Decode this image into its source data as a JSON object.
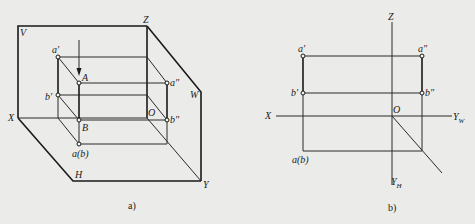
{
  "figure_a": {
    "caption": "a)",
    "planes": {
      "V": "V",
      "H": "H",
      "W": "W"
    },
    "axes": {
      "X": "X",
      "Y": "Y",
      "Z": "Z",
      "O": "O"
    },
    "points": {
      "a_prime": "a′",
      "b_prime": "b′",
      "A": "A",
      "B": "B",
      "a_dprime": "a″",
      "b_dprime": "b″",
      "ab_h": "a(b)"
    }
  },
  "figure_b": {
    "caption": "b)",
    "axes": {
      "X": "X",
      "Z": "Z",
      "O": "O",
      "YW": "Y",
      "YW_sub": "W",
      "YH": "Y",
      "YH_sub": "H"
    },
    "points": {
      "a_prime": "a′",
      "b_prime": "b′",
      "a_dprime": "a″",
      "b_dprime": "b″",
      "ab_h": "a(b)"
    }
  },
  "colors": {
    "background": "#ebebe9",
    "line": "#2a2a2a"
  }
}
